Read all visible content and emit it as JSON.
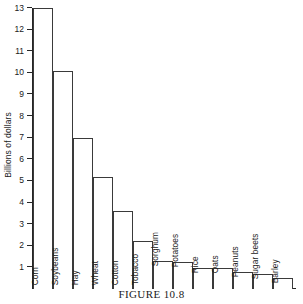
{
  "caption": "FIGURE 10.8",
  "chart_data": {
    "type": "bar",
    "title": "",
    "xlabel": "",
    "ylabel": "Billions of dollars",
    "ylim": [
      0,
      13
    ],
    "grid": false,
    "legend": null,
    "ytick_labels": [
      "13",
      "12",
      "11",
      "10",
      "9",
      "8",
      "7",
      "6",
      "5",
      "4",
      "3",
      "2",
      "1"
    ],
    "yticks": [
      13,
      12,
      11,
      10,
      9,
      8,
      7,
      6,
      5,
      4,
      3,
      2,
      1
    ],
    "categories": [
      "Corn",
      "Soybeans",
      "Hay",
      "Wheat",
      "Cotton",
      "Tobacco",
      "Sorghum",
      "Potatoes",
      "Rice",
      "Oats",
      "Peanuts",
      "Sugar beets",
      "Barley"
    ],
    "values": [
      13.0,
      10.1,
      7.0,
      5.2,
      3.6,
      2.2,
      1.3,
      1.25,
      0.95,
      0.95,
      0.8,
      0.7,
      0.5
    ],
    "bar_face_color": "#ffffff",
    "bar_edge_color": "#3a3a3a",
    "axis_color": "#262626",
    "label_placement": [
      "inside",
      "inside",
      "inside",
      "inside",
      "inside",
      "inside",
      "outside",
      "outside",
      "outside",
      "outside",
      "outside",
      "outside",
      "outside"
    ]
  }
}
